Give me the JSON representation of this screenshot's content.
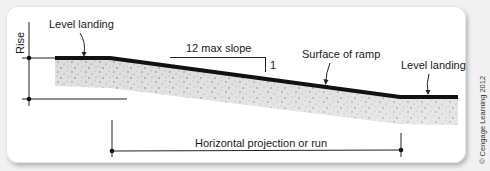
{
  "diagram": {
    "type": "ramp cross-section",
    "labels": {
      "rise": "Rise",
      "top_landing": "Level landing",
      "slope": "12 max slope",
      "slope_rise": "1",
      "surface": "Surface of ramp",
      "bottom_landing": "Level landing",
      "run": "Horizontal projection or run"
    },
    "credit": "© Cengage Learning 2012",
    "colors": {
      "surface_line": "#111111",
      "concrete_fill": "#d9d9d9",
      "speckle": "#6a6a6a",
      "dimension_line": "#222222",
      "frame_bg": "#ffffff",
      "page_bg": "#f1f1f1"
    }
  }
}
